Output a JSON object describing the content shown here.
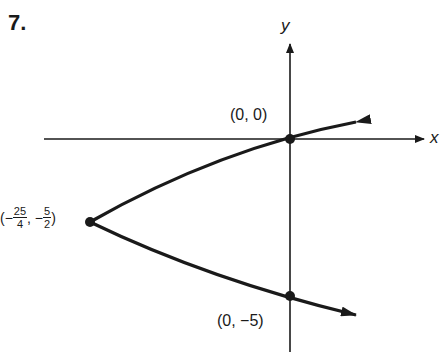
{
  "problem_number": "7.",
  "axes": {
    "x_label": "x",
    "y_label": "y"
  },
  "curve": {
    "equation": "x = y^2/... parabola opening right",
    "vertex": {
      "x": -6.25,
      "y": -2.5
    }
  },
  "points": [
    {
      "name": "origin",
      "label": "(0, 0)",
      "x": 0,
      "y": 0
    },
    {
      "name": "vertex",
      "label_prefix": "(−",
      "frac1_num": "25",
      "frac1_den": "4",
      "label_mid": ", −",
      "frac2_num": "5",
      "frac2_den": "2",
      "label_suffix": ")",
      "x": -6.25,
      "y": -2.5
    },
    {
      "name": "y-intercept",
      "label": "(0, −5)",
      "x": 0,
      "y": -5
    }
  ]
}
